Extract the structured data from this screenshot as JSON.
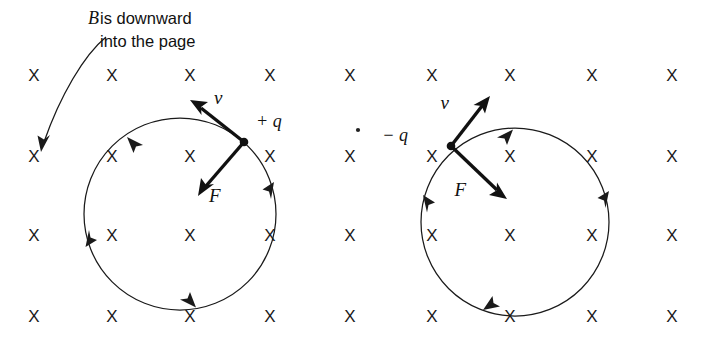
{
  "figure": {
    "name": "magnetic-force-on-moving-charges",
    "background_color": "#ffffff",
    "ink_color": "#1a1a1a",
    "width": 706,
    "height": 348
  },
  "caption": {
    "symbol": "B",
    "line1": " is downward",
    "line2": "into the page",
    "full_text": "B is downward into the page",
    "pointer_name": "caption-pointer-arrow"
  },
  "field": {
    "symbol": "X",
    "meaning": "magnetic-field-into-page",
    "rows": 4,
    "columns": 9,
    "row_y": [
      77,
      158,
      237,
      318
    ],
    "column_x": [
      34,
      112,
      190,
      270,
      350,
      432,
      510,
      592,
      672
    ]
  },
  "speck": {
    "x": 358,
    "y": 130
  },
  "particles": [
    {
      "id": "positive",
      "charge_label": "+ q",
      "velocity_label": "v",
      "force_label": "F",
      "circle": {
        "cx": 180,
        "cy": 214,
        "r": 96
      },
      "point": {
        "x": 244,
        "y": 142
      },
      "velocity_tip": {
        "x": 196,
        "y": 104
      },
      "force_tip": {
        "x": 202,
        "y": 190
      },
      "orbit_direction": "counterclockwise",
      "charge_label_pos": {
        "x": 256,
        "y": 127
      },
      "velocity_label_pos": {
        "x": 214,
        "y": 104
      },
      "force_label_pos": {
        "x": 209,
        "y": 200
      }
    },
    {
      "id": "negative",
      "charge_label": "− q",
      "velocity_label": "v",
      "force_label": "F",
      "circle": {
        "cx": 515,
        "cy": 222,
        "r": 94
      },
      "point": {
        "x": 451,
        "y": 146
      },
      "velocity_tip": {
        "x": 486,
        "y": 101
      },
      "force_tip": {
        "x": 504,
        "y": 196
      },
      "orbit_direction": "clockwise",
      "charge_label_pos": {
        "x": 408,
        "y": 140
      },
      "velocity_label_pos": {
        "x": 456,
        "y": 107
      },
      "force_label_pos": {
        "x": 466,
        "y": 192
      }
    }
  ]
}
